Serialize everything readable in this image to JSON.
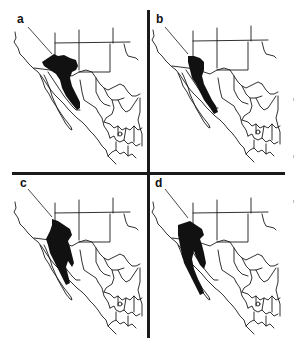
{
  "figure": {
    "colors": {
      "range_fill": "#111111",
      "border_stroke": "#1a1a1a",
      "background": "#ffffff"
    },
    "panels": [
      {
        "id": "a",
        "label": "a",
        "position": "top-left"
      },
      {
        "id": "b",
        "label": "b",
        "position": "top-right"
      },
      {
        "id": "c",
        "label": "c",
        "position": "bottom-left"
      },
      {
        "id": "d",
        "label": "d",
        "position": "bottom-right"
      }
    ]
  }
}
